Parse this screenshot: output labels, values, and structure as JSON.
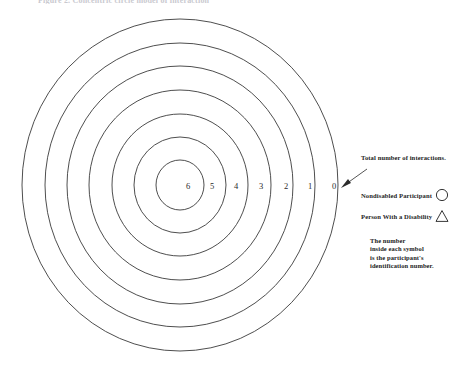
{
  "figure": {
    "top_caption_clipped": "Figure 2.  Concentric circle model of interaction",
    "diagram": {
      "type": "concentric-rings",
      "ring_count": 7,
      "center": {
        "x": 180,
        "y": 185
      },
      "outer_radius": {
        "rx": 158,
        "ry": 166
      },
      "ring_labels": [
        "6",
        "5",
        "4",
        "3",
        "2",
        "1",
        "0"
      ],
      "ring_label_meaning": "Total number of interactions",
      "rings": [
        {
          "label": "6",
          "rx": 24,
          "ry": 25
        },
        {
          "label": "5",
          "rx": 46,
          "ry": 48
        },
        {
          "label": "4",
          "rx": 68,
          "ry": 71
        },
        {
          "label": "3",
          "rx": 91,
          "ry": 95
        },
        {
          "label": "2",
          "rx": 113,
          "ry": 119
        },
        {
          "label": "1",
          "rx": 135,
          "ry": 142
        },
        {
          "label": "0",
          "rx": 158,
          "ry": 166
        }
      ]
    },
    "pointer": {
      "name": "interaction-count-pointer",
      "from": {
        "x": 368,
        "y": 170
      },
      "to": {
        "x": 341,
        "y": 188
      }
    }
  },
  "legend": {
    "caption": "Total number of interactions.",
    "entries": [
      {
        "label": "Nondisabled Participant",
        "symbol": "circle-symbol"
      },
      {
        "label": "Person With a Disability",
        "symbol": "triangle-symbol"
      }
    ],
    "note_lines": [
      "The number",
      "inside each symbol",
      "is the participant's",
      "identification number."
    ]
  },
  "colors": {
    "background": "#ffffff",
    "ink": "#2b2b2b",
    "ring_stroke": "#3a3a3a",
    "faint_caption": "#c9c9cf"
  }
}
